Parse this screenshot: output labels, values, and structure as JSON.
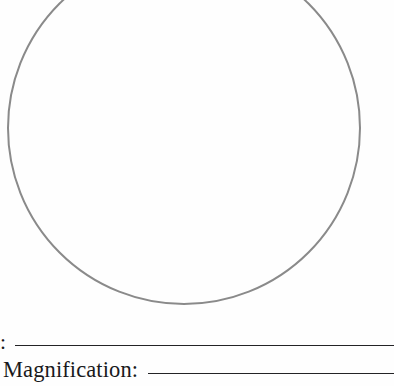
{
  "page": {
    "kind": "specimen-drawing-worksheet",
    "background_color": "#fefefe",
    "width": 394,
    "height": 386
  },
  "drawing": {
    "shape_name": "drawing-circle",
    "description": "Large empty circle for sketching the microscope field of view",
    "stroke_color": "#8a8a8a",
    "stroke_width": 2,
    "center_x": 184,
    "center_y": 128,
    "radius": 176,
    "cropped_at_top": true,
    "fill": "none"
  },
  "fields": [
    {
      "id": "specimen",
      "label": "cimen:",
      "label_full": "Specimen:",
      "value": "",
      "placeholder": "",
      "rule_color": "#232326"
    },
    {
      "id": "magnification",
      "label": "Magnification:",
      "label_full": "Magnification:",
      "value": "",
      "placeholder": "",
      "rule_color": "#232326"
    }
  ]
}
